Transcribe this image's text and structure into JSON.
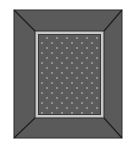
{
  "image": {
    "subject": "picture-frame-icon",
    "description": "Dark gray picture frame with beveled corners, light gray inner mat border, and a dark dotted picture area"
  },
  "colors": {
    "background": "#ffffff",
    "frame_fill": "#5a5a5a",
    "frame_edge": "#2b2b2b",
    "bevel_line": "#1e1e1e",
    "mat_light": "#c8c8c8",
    "mat_dark": "#3a3a3a",
    "picture_fill": "#5c5c5c",
    "dot_color": "#a8a8a8"
  }
}
